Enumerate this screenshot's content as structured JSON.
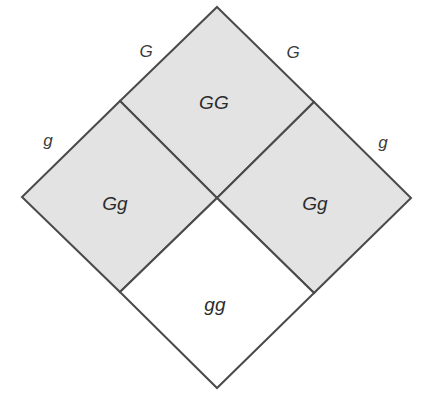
{
  "figure": {
    "name": "punnett-square-diamond",
    "orientation": "rotated-45",
    "background_color": "#ffffff",
    "shaded_fill": "#e3e3e3",
    "unshaded_fill": "#ffffff",
    "stroke_color": "#4a4a4a",
    "stroke_width": 2
  },
  "geometry": {
    "top_vertex": [
      217,
      7
    ],
    "left_vertex": [
      22,
      197
    ],
    "right_vertex": [
      411,
      198
    ],
    "bottom_vertex": [
      217,
      388
    ],
    "center": [
      217,
      198
    ],
    "mid_top_left": [
      120,
      101
    ],
    "mid_top_right": [
      314,
      102
    ],
    "mid_bottom_left": [
      120,
      292
    ],
    "mid_bottom_right": [
      314,
      293
    ]
  },
  "cells": [
    {
      "id": "cell-gg-dominant",
      "genotype": "GG",
      "shaded": true,
      "position": "top",
      "x": 214,
      "y": 103
    },
    {
      "id": "cell-gg-het-left",
      "genotype": "Gg",
      "shaded": true,
      "position": "left",
      "x": 115,
      "y": 204
    },
    {
      "id": "cell-gg-het-right",
      "genotype": "Gg",
      "shaded": true,
      "position": "right",
      "x": 315,
      "y": 204
    },
    {
      "id": "cell-gg-recessive",
      "genotype": "gg",
      "shaded": false,
      "position": "bottom",
      "x": 215,
      "y": 305
    }
  ],
  "alleles": [
    {
      "id": "allele-top-left",
      "label": "G",
      "x": 146,
      "y": 52
    },
    {
      "id": "allele-top-right",
      "label": "G",
      "x": 293,
      "y": 53
    },
    {
      "id": "allele-bottom-left",
      "label": "g",
      "x": 48,
      "y": 141
    },
    {
      "id": "allele-bottom-right",
      "label": "g",
      "x": 383,
      "y": 143
    }
  ]
}
